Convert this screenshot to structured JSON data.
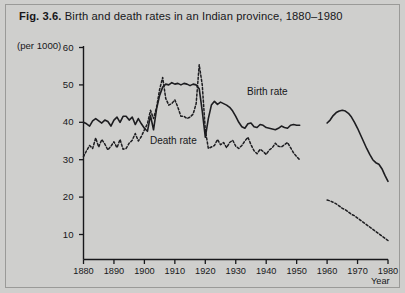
{
  "figure": {
    "number": "Fig. 3.6.",
    "caption": "Birth and death rates in an Indian province, 1880–1980",
    "background_color": "#cfcfcd",
    "frame_color": "#9a9a98",
    "ink_color": "#17171a"
  },
  "axes": {
    "y_unit_label": "(per 1000)",
    "y_ticks": [
      10,
      20,
      30,
      40,
      50,
      60
    ],
    "x_ticks": [
      1880,
      1890,
      1900,
      1910,
      1920,
      1930,
      1940,
      1950,
      1960,
      1970,
      1980
    ],
    "x_axis_label": "Year",
    "ylim": [
      0,
      60
    ],
    "xlim": [
      1880,
      1980
    ],
    "grid": false
  },
  "series_labels": {
    "birth": "Birth rate",
    "death": "Death rate"
  },
  "chart_data": {
    "type": "line",
    "title": "Birth and death rates in an Indian province, 1880–1980",
    "xlabel": "Year",
    "ylabel": "(per 1000)",
    "xlim": [
      1880,
      1980
    ],
    "ylim": [
      0,
      60
    ],
    "grid": false,
    "legend_position": "inline-annotations",
    "annotations": [
      {
        "text": "Birth rate",
        "x": 1936,
        "y": 45
      },
      {
        "text": "Death rate",
        "x": 1906,
        "y": 31
      }
    ],
    "series": [
      {
        "name": "Birth rate",
        "style": "solid",
        "color": "#1d1d20",
        "note": "gap in record between 1951 and 1960",
        "points": [
          [
            1880,
            40.0
          ],
          [
            1881,
            39.6
          ],
          [
            1882,
            39.0
          ],
          [
            1883,
            40.4
          ],
          [
            1884,
            41.0
          ],
          [
            1885,
            40.4
          ],
          [
            1886,
            39.8
          ],
          [
            1887,
            40.6
          ],
          [
            1888,
            40.2
          ],
          [
            1889,
            39.0
          ],
          [
            1890,
            40.6
          ],
          [
            1891,
            41.4
          ],
          [
            1892,
            40.0
          ],
          [
            1893,
            41.6
          ],
          [
            1894,
            41.6
          ],
          [
            1895,
            40.6
          ],
          [
            1896,
            41.4
          ],
          [
            1897,
            39.4
          ],
          [
            1898,
            41.0
          ],
          [
            1899,
            39.6
          ],
          [
            1900,
            38.4
          ],
          [
            1901,
            37.6
          ],
          [
            1902,
            41.8
          ],
          [
            1903,
            38.0
          ],
          [
            1904,
            43.6
          ],
          [
            1905,
            47.2
          ],
          [
            1906,
            49.4
          ],
          [
            1907,
            50.2
          ],
          [
            1908,
            50.0
          ],
          [
            1909,
            50.6
          ],
          [
            1910,
            50.2
          ],
          [
            1911,
            50.4
          ],
          [
            1912,
            50.0
          ],
          [
            1913,
            50.4
          ],
          [
            1914,
            50.2
          ],
          [
            1915,
            49.8
          ],
          [
            1916,
            50.2
          ],
          [
            1917,
            50.0
          ],
          [
            1918,
            49.0
          ],
          [
            1919,
            43.0
          ],
          [
            1920,
            36.0
          ],
          [
            1921,
            41.0
          ],
          [
            1922,
            44.6
          ],
          [
            1923,
            45.6
          ],
          [
            1924,
            44.8
          ],
          [
            1925,
            45.4
          ],
          [
            1926,
            45.0
          ],
          [
            1927,
            44.6
          ],
          [
            1928,
            44.0
          ],
          [
            1929,
            43.0
          ],
          [
            1930,
            41.6
          ],
          [
            1931,
            40.0
          ],
          [
            1932,
            38.8
          ],
          [
            1933,
            38.4
          ],
          [
            1934,
            39.6
          ],
          [
            1935,
            39.8
          ],
          [
            1936,
            38.8
          ],
          [
            1937,
            38.6
          ],
          [
            1938,
            39.4
          ],
          [
            1939,
            39.2
          ],
          [
            1940,
            38.6
          ],
          [
            1941,
            38.4
          ],
          [
            1942,
            38.2
          ],
          [
            1943,
            38.0
          ],
          [
            1944,
            38.4
          ],
          [
            1945,
            39.0
          ],
          [
            1946,
            38.6
          ],
          [
            1947,
            38.4
          ],
          [
            1948,
            39.2
          ],
          [
            1949,
            39.4
          ],
          [
            1950,
            39.2
          ],
          [
            1951,
            39.2
          ],
          [
            1960,
            39.8
          ],
          [
            1961,
            40.6
          ],
          [
            1962,
            41.8
          ],
          [
            1963,
            42.6
          ],
          [
            1964,
            43.0
          ],
          [
            1965,
            43.2
          ],
          [
            1966,
            43.0
          ],
          [
            1967,
            42.4
          ],
          [
            1968,
            41.4
          ],
          [
            1969,
            40.0
          ],
          [
            1970,
            38.4
          ],
          [
            1971,
            36.6
          ],
          [
            1972,
            34.8
          ],
          [
            1973,
            33.0
          ],
          [
            1974,
            31.4
          ],
          [
            1975,
            30.0
          ],
          [
            1976,
            29.2
          ],
          [
            1977,
            28.8
          ],
          [
            1978,
            27.6
          ],
          [
            1979,
            25.8
          ],
          [
            1980,
            24.2
          ]
        ]
      },
      {
        "name": "Death rate",
        "style": "dashed",
        "color": "#1d1d20",
        "note": "gap in record between 1951 and 1960",
        "points": [
          [
            1880,
            30.8
          ],
          [
            1881,
            32.4
          ],
          [
            1882,
            33.8
          ],
          [
            1883,
            33.0
          ],
          [
            1884,
            35.8
          ],
          [
            1885,
            33.4
          ],
          [
            1886,
            35.4
          ],
          [
            1887,
            34.2
          ],
          [
            1888,
            32.6
          ],
          [
            1889,
            33.6
          ],
          [
            1890,
            34.8
          ],
          [
            1891,
            33.2
          ],
          [
            1892,
            35.4
          ],
          [
            1893,
            32.8
          ],
          [
            1894,
            33.0
          ],
          [
            1895,
            34.4
          ],
          [
            1896,
            35.2
          ],
          [
            1897,
            37.0
          ],
          [
            1898,
            35.0
          ],
          [
            1899,
            36.2
          ],
          [
            1900,
            38.0
          ],
          [
            1901,
            39.6
          ],
          [
            1902,
            43.2
          ],
          [
            1903,
            41.0
          ],
          [
            1904,
            44.0
          ],
          [
            1905,
            48.8
          ],
          [
            1906,
            52.0
          ],
          [
            1907,
            46.4
          ],
          [
            1908,
            44.6
          ],
          [
            1909,
            45.0
          ],
          [
            1910,
            46.0
          ],
          [
            1911,
            44.0
          ],
          [
            1912,
            41.6
          ],
          [
            1913,
            41.6
          ],
          [
            1914,
            41.0
          ],
          [
            1915,
            41.4
          ],
          [
            1916,
            42.2
          ],
          [
            1917,
            45.0
          ],
          [
            1918,
            55.4
          ],
          [
            1919,
            50.0
          ],
          [
            1920,
            38.0
          ],
          [
            1921,
            33.0
          ],
          [
            1922,
            33.4
          ],
          [
            1923,
            33.8
          ],
          [
            1924,
            35.4
          ],
          [
            1925,
            34.0
          ],
          [
            1926,
            34.6
          ],
          [
            1927,
            33.2
          ],
          [
            1928,
            34.6
          ],
          [
            1929,
            35.2
          ],
          [
            1930,
            33.6
          ],
          [
            1931,
            33.0
          ],
          [
            1932,
            33.8
          ],
          [
            1933,
            35.0
          ],
          [
            1934,
            36.0
          ],
          [
            1935,
            34.0
          ],
          [
            1936,
            32.4
          ],
          [
            1937,
            31.6
          ],
          [
            1938,
            32.8
          ],
          [
            1939,
            32.2
          ],
          [
            1940,
            31.4
          ],
          [
            1941,
            32.6
          ],
          [
            1942,
            33.2
          ],
          [
            1943,
            34.4
          ],
          [
            1944,
            33.6
          ],
          [
            1945,
            33.4
          ],
          [
            1946,
            34.0
          ],
          [
            1947,
            34.6
          ],
          [
            1948,
            33.2
          ],
          [
            1949,
            31.8
          ],
          [
            1950,
            30.8
          ],
          [
            1951,
            30.0
          ],
          [
            1960,
            19.2
          ],
          [
            1961,
            19.0
          ],
          [
            1962,
            18.6
          ],
          [
            1963,
            18.2
          ],
          [
            1964,
            17.6
          ],
          [
            1965,
            17.0
          ],
          [
            1966,
            16.6
          ],
          [
            1967,
            16.0
          ],
          [
            1968,
            15.4
          ],
          [
            1969,
            15.0
          ],
          [
            1970,
            14.4
          ],
          [
            1971,
            13.8
          ],
          [
            1972,
            13.2
          ],
          [
            1973,
            12.6
          ],
          [
            1974,
            12.0
          ],
          [
            1975,
            11.4
          ],
          [
            1976,
            10.8
          ],
          [
            1977,
            10.2
          ],
          [
            1978,
            9.6
          ],
          [
            1979,
            9.0
          ],
          [
            1980,
            8.4
          ]
        ]
      }
    ]
  }
}
